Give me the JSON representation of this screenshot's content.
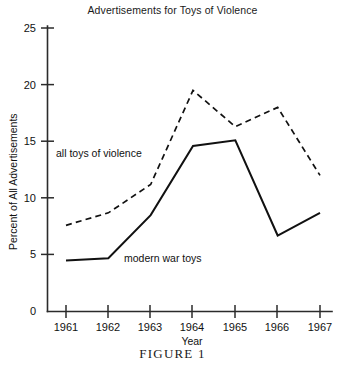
{
  "figure": {
    "caption": "FIGURE 1"
  },
  "chart_data": {
    "type": "line",
    "title": "Advertisements for Toys of Violence",
    "xlabel": "Year",
    "ylabel": "Percent of All Advertisements",
    "categories": [
      "1961",
      "1962",
      "1963",
      "1964",
      "1965",
      "1966",
      "1967"
    ],
    "x": [
      1961,
      1962,
      1963,
      1964,
      1965,
      1966,
      1967
    ],
    "xlim": [
      1961,
      1967
    ],
    "ylim": [
      0,
      25
    ],
    "yticks": [
      "0",
      "5",
      "10",
      "15",
      "20",
      "25"
    ],
    "ytick_values": [
      0,
      5,
      10,
      15,
      20,
      25
    ],
    "grid": false,
    "legend_position": "inline-annotations",
    "series": [
      {
        "name": "all toys of violence",
        "style": "dashed",
        "color": "#111111",
        "values": [
          7.6,
          8.7,
          11.2,
          19.5,
          16.3,
          18.0,
          12.0
        ]
      },
      {
        "name": "modern war toys",
        "style": "solid",
        "color": "#111111",
        "values": [
          4.5,
          4.7,
          8.5,
          14.6,
          15.1,
          6.7,
          8.7
        ]
      }
    ],
    "annotations": [
      {
        "text": "all toys of violence",
        "series": "all toys of violence"
      },
      {
        "text": "modern war toys",
        "series": "modern war toys"
      }
    ]
  }
}
